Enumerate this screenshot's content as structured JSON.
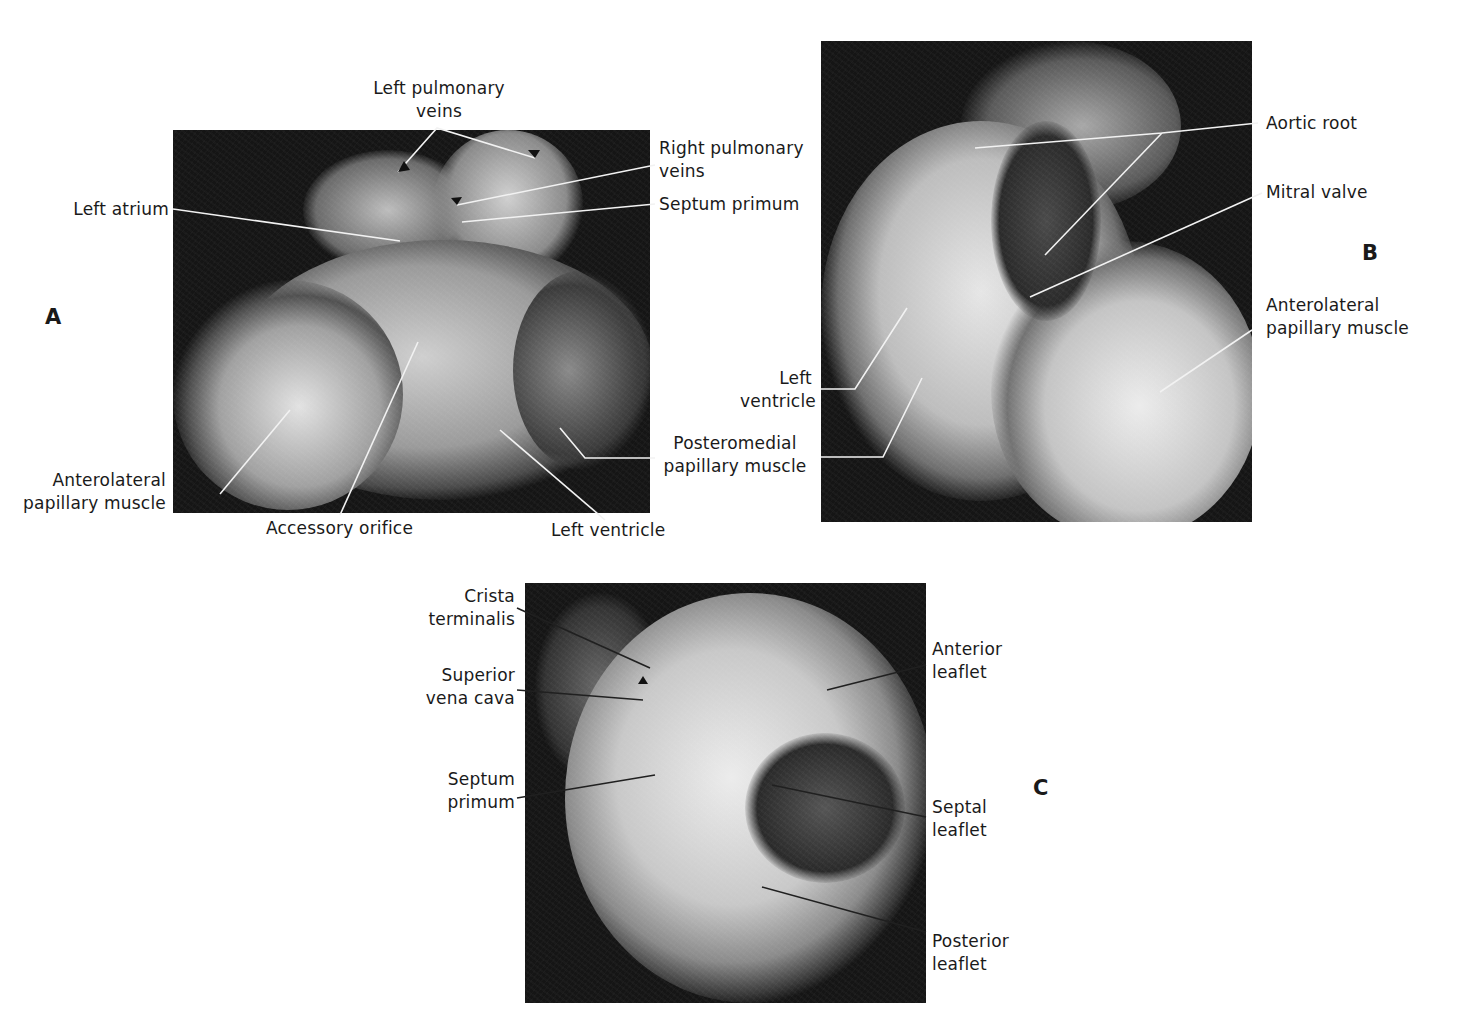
{
  "figure": {
    "panels": [
      {
        "id": "A",
        "letter": "A",
        "labels": {
          "left_pulmonary_veins": [
            "Left pulmonary",
            "veins"
          ],
          "right_pulmonary_veins": [
            "Right pulmonary",
            "veins"
          ],
          "septum_primum": [
            "Septum primum"
          ],
          "left_atrium": [
            "Left atrium"
          ],
          "anterolateral_papillary_muscle": [
            "Anterolateral",
            "papillary muscle"
          ],
          "accessory_orifice": [
            "Accessory orifice"
          ],
          "left_ventricle": [
            "Left ventricle"
          ],
          "posteromedial_papillary_muscle": [
            "Posteromedial",
            "papillary muscle"
          ]
        }
      },
      {
        "id": "B",
        "letter": "B",
        "labels": {
          "aortic_root": [
            "Aortic root"
          ],
          "mitral_valve": [
            "Mitral valve"
          ],
          "anterolateral_papillary_muscle": [
            "Anterolateral",
            "papillary muscle"
          ],
          "left_ventricle": [
            "Left",
            "ventricle"
          ]
        }
      },
      {
        "id": "C",
        "letter": "C",
        "labels": {
          "crista_terminalis": [
            "Crista",
            "terminalis"
          ],
          "superior_vena_cava": [
            "Superior",
            "vena cava"
          ],
          "septum_primum": [
            "Septum",
            "primum"
          ],
          "anterior_leaflet": [
            "Anterior",
            "leaflet"
          ],
          "septal_leaflet": [
            "Septal",
            "leaflet"
          ],
          "posterior_leaflet": [
            "Posterior",
            "leaflet"
          ]
        }
      }
    ]
  }
}
